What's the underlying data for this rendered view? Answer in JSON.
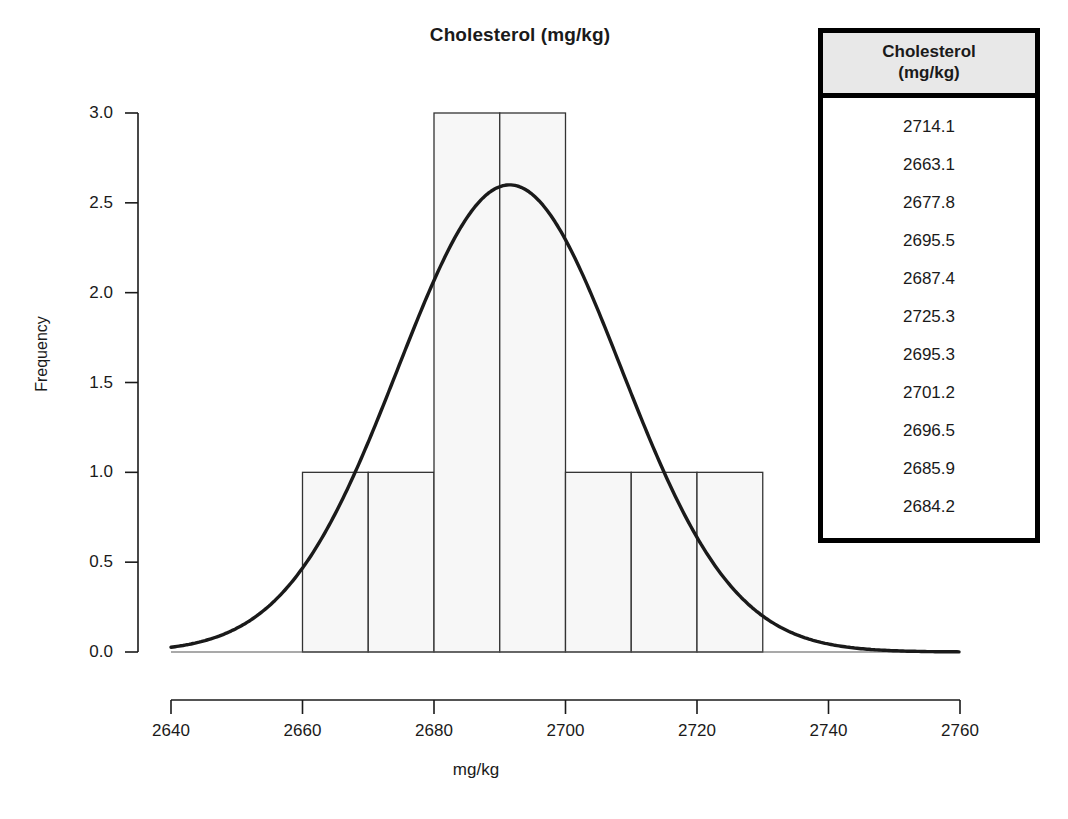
{
  "chart_data": {
    "type": "bar",
    "title": "Cholesterol (mg/kg)",
    "xlabel": "mg/kg",
    "ylabel": "Frequency",
    "xlim": [
      2640,
      2760
    ],
    "ylim": [
      0,
      3.0
    ],
    "grid": false,
    "legend": null,
    "x_ticks": [
      "2640",
      "2660",
      "2680",
      "2700",
      "2720",
      "2740",
      "2760"
    ],
    "x_tick_values": [
      2640,
      2660,
      2680,
      2700,
      2720,
      2740,
      2760
    ],
    "y_ticks": [
      "0.0",
      "0.5",
      "1.0",
      "1.5",
      "2.0",
      "2.5",
      "3.0"
    ],
    "y_tick_values": [
      0.0,
      0.5,
      1.0,
      1.5,
      2.0,
      2.5,
      3.0
    ],
    "bin_width": 10,
    "bins": [
      {
        "start": 2660,
        "end": 2670,
        "value": 1
      },
      {
        "start": 2670,
        "end": 2680,
        "value": 1
      },
      {
        "start": 2680,
        "end": 2690,
        "value": 3
      },
      {
        "start": 2690,
        "end": 2700,
        "value": 3
      },
      {
        "start": 2700,
        "end": 2710,
        "value": 1
      },
      {
        "start": 2710,
        "end": 2720,
        "value": 1
      },
      {
        "start": 2720,
        "end": 2730,
        "value": 1
      }
    ],
    "categories": [
      "2660-2670",
      "2670-2680",
      "2680-2690",
      "2690-2700",
      "2700-2710",
      "2710-2720",
      "2720-2730"
    ],
    "values": [
      1,
      1,
      3,
      3,
      1,
      1,
      1
    ],
    "overlay_curve": {
      "name": "normal-density-fit",
      "mean": 2691.5,
      "sigma": 17.0,
      "peak_value": 2.6,
      "style": "solid-black-line"
    },
    "bar_fill": "#f7f7f7",
    "bar_stroke": "#333333",
    "curve_color": "#1a1a1a"
  },
  "data_table": {
    "header_line1": "Cholesterol",
    "header_line2": "(mg/kg)",
    "values": [
      "2714.1",
      "2663.1",
      "2677.8",
      "2695.5",
      "2687.4",
      "2725.3",
      "2695.3",
      "2701.2",
      "2696.5",
      "2685.9",
      "2684.2"
    ]
  }
}
